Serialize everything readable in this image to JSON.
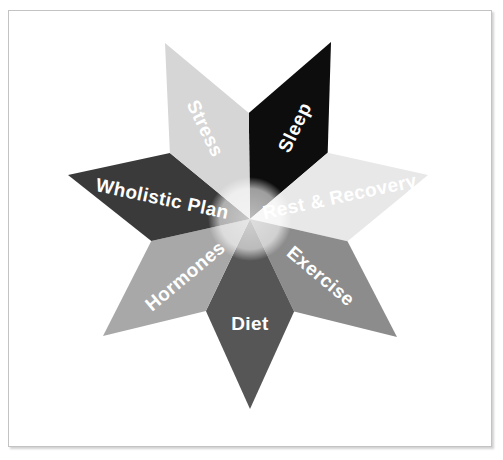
{
  "document": {
    "title": "Wholistic Health Star Diagram",
    "background_color": "#ffffff",
    "frame_border_color": "#c3c3c3"
  },
  "chart_data": {
    "type": "pie",
    "title": "",
    "subtitle": "",
    "xlabel": "",
    "ylabel": "",
    "legend_position": "none",
    "grid": false,
    "center": {
      "x": 250,
      "y": 219
    },
    "inner_radius": 40,
    "categories": [
      "Sleep",
      "Rest & Recovery",
      "Exercise",
      "Diet",
      "Hormones",
      "Wholistic Plan",
      "Stress"
    ],
    "values": [
      1,
      1,
      1,
      1,
      1,
      1,
      1
    ],
    "slices": [
      {
        "label": "Sleep",
        "color": "#0d0d0d",
        "text_color": "#ffffff",
        "tip": {
          "x": 331,
          "y": 42
        },
        "angle_deg": -64,
        "label_rotation_deg": -64,
        "label_x": 296,
        "label_y": 128,
        "font_size": 19
      },
      {
        "label": "Rest & Recovery",
        "color": "#e8e8e8",
        "text_color": "#ffffff",
        "tip": {
          "x": 428,
          "y": 175
        },
        "angle_deg": -12,
        "label_rotation_deg": -12,
        "label_x": 340,
        "label_y": 198,
        "font_size": 19
      },
      {
        "label": "Exercise",
        "color": "#8c8c8c",
        "text_color": "#ffffff",
        "tip": {
          "x": 397,
          "y": 337
        },
        "angle_deg": 40,
        "label_rotation_deg": 40,
        "label_x": 320,
        "label_y": 277,
        "font_size": 19
      },
      {
        "label": "Diet",
        "color": "#565656",
        "text_color": "#ffffff",
        "tip": {
          "x": 250,
          "y": 409
        },
        "angle_deg": 90,
        "label_rotation_deg": 0,
        "label_x": 250,
        "label_y": 325,
        "font_size": 19
      },
      {
        "label": "Hormones",
        "color": "#a8a8a8",
        "text_color": "#ffffff",
        "tip": {
          "x": 103,
          "y": 336
        },
        "angle_deg": 140,
        "label_rotation_deg": -40,
        "label_x": 186,
        "label_y": 277,
        "font_size": 19
      },
      {
        "label": "Wholistic Plan",
        "color": "#3a3a3a",
        "text_color": "#ffffff",
        "tip": {
          "x": 68,
          "y": 175
        },
        "angle_deg": 192,
        "label_rotation_deg": 12,
        "label_x": 162,
        "label_y": 200,
        "font_size": 19
      },
      {
        "label": "Stress",
        "color": "#d6d6d6",
        "text_color": "#ffffff",
        "tip": {
          "x": 165,
          "y": 43
        },
        "angle_deg": 244,
        "label_rotation_deg": 64,
        "label_x": 204,
        "label_y": 129,
        "font_size": 19
      }
    ]
  }
}
